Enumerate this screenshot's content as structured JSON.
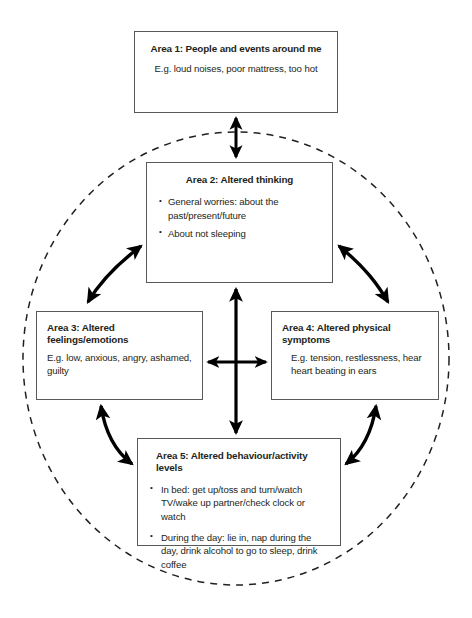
{
  "diagram": {
    "name": "five-areas-insomnia-vicious-cycle",
    "colors": {
      "box_border": "#58595b",
      "text": "#231f20",
      "arrow": "#000000",
      "circle_dash": "#231f20",
      "background": "#ffffff"
    },
    "circle": {
      "style": "dashed",
      "label": "vicious-cycle-boundary"
    },
    "areas": [
      {
        "id": "area-1",
        "title": "Area 1: People and events around me",
        "body": "E.g. loud noises, poor mattress, too hot",
        "bullets": []
      },
      {
        "id": "area-2",
        "title": "Area 2: Altered thinking",
        "body": "",
        "bullets": [
          "General worries: about the past/present/future",
          "About not sleeping"
        ]
      },
      {
        "id": "area-3",
        "title": "Area 3: Altered feelings/emotions",
        "body": "E.g. low, anxious, angry, ashamed, guilty",
        "bullets": []
      },
      {
        "id": "area-4",
        "title": "Area 4: Altered physical symptoms",
        "body": "E.g. tension, restlessness, hear heart beating in ears",
        "bullets": []
      },
      {
        "id": "area-5",
        "title": "Area 5: Altered behaviour/activity levels",
        "body": "",
        "bullets": [
          "In bed: get up/toss and turn/watch TV/wake up partner/check clock or watch",
          "During the day: lie in, nap during the day, drink alcohol to go to sleep, drink coffee"
        ]
      }
    ],
    "connectors": [
      {
        "id": "arrow-area1-area2",
        "from": "area-1",
        "to": "area-2",
        "direction": "double",
        "shape": "straight-vertical"
      },
      {
        "id": "arrow-area2-area3",
        "from": "area-2",
        "to": "area-3",
        "direction": "double",
        "shape": "curved"
      },
      {
        "id": "arrow-area2-area4",
        "from": "area-2",
        "to": "area-4",
        "direction": "double",
        "shape": "curved"
      },
      {
        "id": "arrow-area3-area5",
        "from": "area-3",
        "to": "area-5",
        "direction": "double",
        "shape": "curved"
      },
      {
        "id": "arrow-area4-area5",
        "from": "area-4",
        "to": "area-5",
        "direction": "double",
        "shape": "curved"
      },
      {
        "id": "arrow-area2-area5-vertical",
        "from": "area-2",
        "to": "area-5",
        "direction": "double",
        "shape": "straight-vertical"
      },
      {
        "id": "arrow-area3-area4-horizontal",
        "from": "area-3",
        "to": "area-4",
        "direction": "double",
        "shape": "straight-horizontal"
      }
    ]
  }
}
